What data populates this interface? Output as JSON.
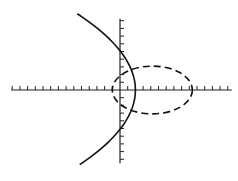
{
  "diagram": {
    "type": "coordinate-plane",
    "axes": {
      "origin_px": [
        120,
        90
      ],
      "unit_px": 7.7,
      "x_ticks": {
        "min": -14,
        "max": 14
      },
      "y_ticks": {
        "min": -9,
        "max": 9
      },
      "stroke": "#222222"
    },
    "curves": [
      {
        "name": "parabola",
        "style": "solid",
        "equation": "x = 2 - y^2/13",
        "vertex": [
          2,
          0
        ],
        "y_intercepts": [
          5.1,
          -5.1
        ],
        "stroke": "#111111"
      },
      {
        "name": "ellipse",
        "style": "dashed",
        "center": [
          4.2,
          0
        ],
        "semi_axes": [
          5.2,
          3.1
        ],
        "stroke": "#111111"
      }
    ]
  }
}
